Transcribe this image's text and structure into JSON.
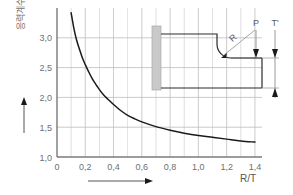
{
  "chart_data": {
    "type": "line",
    "title": "",
    "xlabel": "R/T",
    "ylabel": "응력계수",
    "xlim": [
      0,
      1.45
    ],
    "ylim": [
      1.0,
      3.5
    ],
    "grid": true,
    "legend": "none",
    "x_ticks": [
      "0",
      "0,2",
      "0,4",
      "0,6",
      "0,8",
      "1,0",
      "1,2",
      "1,4"
    ],
    "x_tick_values": [
      0,
      0.2,
      0.4,
      0.6,
      0.8,
      1.0,
      1.2,
      1.4
    ],
    "y_ticks": [
      "1,0",
      "1,5",
      "2,0",
      "2,5",
      "3,0"
    ],
    "y_tick_values": [
      1.0,
      1.5,
      2.0,
      2.5,
      3.0
    ],
    "minor_x_step": 0.1,
    "x": [
      0.1,
      0.12,
      0.14,
      0.16,
      0.18,
      0.2,
      0.22,
      0.25,
      0.28,
      0.3,
      0.33,
      0.36,
      0.4,
      0.45,
      0.5,
      0.55,
      0.6,
      0.7,
      0.8,
      0.9,
      1.0,
      1.1,
      1.2,
      1.3,
      1.4
    ],
    "values": [
      3.42,
      3.15,
      2.95,
      2.8,
      2.66,
      2.55,
      2.45,
      2.31,
      2.2,
      2.13,
      2.04,
      1.97,
      1.88,
      1.78,
      1.7,
      1.64,
      1.59,
      1.51,
      1.45,
      1.4,
      1.36,
      1.33,
      1.3,
      1.27,
      1.25
    ],
    "series_name": "stress concentration factor"
  },
  "axes": {
    "y_axis_caption": "응력계수",
    "x_axis_caption": "R/T",
    "left_arrow_icon": "up-arrow-icon",
    "bottom_arrow_icon": "right-arrow-icon"
  },
  "diagram": {
    "name": "cantilever-beam-fillet-diagram",
    "radius_label": "R",
    "load_label": "P",
    "thickness_label": "T'",
    "wall_fill": "#c9c9c9",
    "line_color": "#2b2b2b",
    "leader_color": "#9a9a9a"
  },
  "colors": {
    "curve": "#1a1a1a",
    "grid": "#bdbdbd",
    "axis": "#555555",
    "tick_text": "#6f6f6f",
    "background": "#ffffff"
  }
}
